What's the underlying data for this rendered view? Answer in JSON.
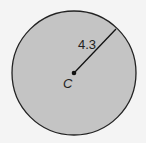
{
  "diagram": {
    "shape": "circle",
    "fill_color": "#c4c4c4",
    "stroke_color": "#222222",
    "background": "#f4f4f4",
    "center_label": "C",
    "radius_label": "4.3"
  }
}
